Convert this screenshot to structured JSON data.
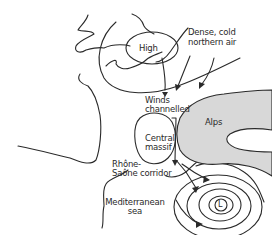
{
  "diagram": {
    "colors": {
      "ink": "#2a2a2a",
      "alps_fill": "#d8d8d8",
      "background": "#ffffff"
    },
    "labels": {
      "high": "High",
      "dense_air_line1": "Dense, cold",
      "dense_air_line2": "northern air",
      "winds_line1": "Winds",
      "winds_line2": "channelled",
      "alps": "Alps",
      "central_line1": "Central",
      "central_line2": "massif",
      "rhone_line1": "Rhône-",
      "rhone_line2": "Saône corridor",
      "med_line1": "Mediterranean",
      "med_line2": "sea",
      "low": "L"
    }
  }
}
